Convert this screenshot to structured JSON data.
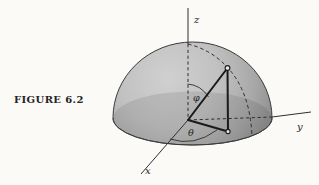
{
  "figure": {
    "caption": "FIGURE 6.2",
    "background": "#fbfaf7",
    "dome_light": "#d0d0d0",
    "dome_dark": "#868686",
    "line_color": "#2f2f2f"
  },
  "labels": {
    "z_axis": "z",
    "y_axis": "y",
    "x_axis": "x",
    "polar_angle": "φ",
    "azimuth_angle": "θ"
  }
}
